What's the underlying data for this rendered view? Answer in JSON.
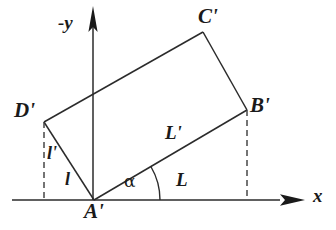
{
  "figure": {
    "stroke_color": "#2b2b2b",
    "text_color": "#1a1a1a",
    "background": "#ffffff"
  },
  "axes": {
    "x_label": "x",
    "y_label": "-y",
    "x_axis": {
      "x1": 12,
      "y1": 200,
      "x2": 292,
      "y2": 200
    },
    "y_axis": {
      "x1": 93,
      "y1": 200,
      "x2": 93,
      "y2": 14
    },
    "x_arrow_tip": {
      "x": 305,
      "y": 200
    },
    "y_arrow_tip": {
      "x": 93,
      "y": 6
    }
  },
  "vertices": [
    {
      "name": "A'",
      "label": "A'",
      "x": 94,
      "y": 200,
      "label_x": 84,
      "label_y": 202
    },
    {
      "name": "B'",
      "label": "B'",
      "x": 247,
      "y": 110,
      "label_x": 249,
      "label_y": 98
    },
    {
      "name": "C'",
      "label": "C'",
      "x": 203,
      "y": 32,
      "label_x": 199,
      "label_y": 8
    },
    {
      "name": "D'",
      "label": "D'",
      "x": 44,
      "y": 122,
      "label_x": 17,
      "label_y": 102
    }
  ],
  "edges": [
    {
      "name": "edge-A-B",
      "from": "A'",
      "to": "B'"
    },
    {
      "name": "edge-B-C",
      "from": "B'",
      "to": "C'"
    },
    {
      "name": "edge-C-D",
      "from": "C'",
      "to": "D'"
    },
    {
      "name": "edge-D-A",
      "from": "D'",
      "to": "A'"
    }
  ],
  "dashed_lines": [
    {
      "name": "dashed-drop-D",
      "x1": 44,
      "y1": 122,
      "x2": 44,
      "y2": 200
    },
    {
      "name": "dashed-drop-B",
      "x1": 247,
      "y1": 110,
      "x2": 247,
      "y2": 200
    }
  ],
  "angle": {
    "symbol": "α",
    "label_x": 125,
    "label_y": 172,
    "arc_radius": 66,
    "vertex_x": 94,
    "vertex_y": 200,
    "start_deg": 0,
    "end_deg": 30.5
  },
  "length_labels": [
    {
      "name": "label-L",
      "text": "L",
      "x": 178,
      "y": 172
    },
    {
      "name": "label-L-prime",
      "text": "L'",
      "x": 166,
      "y": 124
    },
    {
      "name": "label-l",
      "text": "l",
      "x": 66,
      "y": 172
    },
    {
      "name": "label-l-prime",
      "text": "l'",
      "x": 48,
      "y": 146
    }
  ]
}
